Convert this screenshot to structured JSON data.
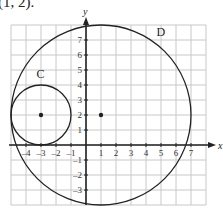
{
  "caption": "(1, 2).",
  "axes": {
    "x_label": "x",
    "y_label": "y",
    "x_ticks": [
      "-4",
      "-3",
      "-2",
      "-1",
      "1",
      "2",
      "3",
      "4",
      "5",
      "6",
      "7"
    ],
    "y_ticks": [
      "7",
      "6",
      "5",
      "4",
      "3",
      "2",
      "1",
      "-1",
      "-2",
      "-3"
    ],
    "x_range": [
      -5,
      8
    ],
    "y_range": [
      -4,
      8
    ]
  },
  "circles": [
    {
      "label": "C",
      "center": [
        -3,
        2
      ],
      "radius": 2
    },
    {
      "label": "D",
      "center": [
        1,
        2
      ],
      "radius": 6
    }
  ],
  "colors": {
    "grid": "#c8c8c8",
    "axis": "#222222",
    "curve": "#222222"
  }
}
